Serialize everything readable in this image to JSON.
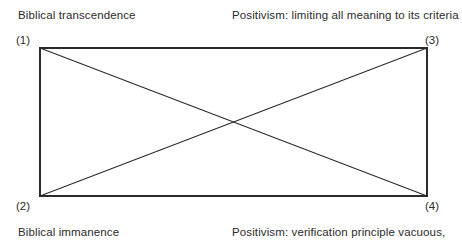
{
  "figure": {
    "type": "quadrant-cross-diagram",
    "background_color": "#ffffff",
    "line_color": "#2b2b2b",
    "text_color": "#2b2b2b",
    "rectangle": {
      "left": 40,
      "top": 48,
      "right": 427,
      "bottom": 196
    },
    "diagonals": [
      {
        "from": "top-left",
        "to": "bottom-right"
      },
      {
        "from": "bottom-left",
        "to": "top-right"
      }
    ],
    "corners": {
      "top_left": "(1)",
      "bottom_left": "(2)",
      "top_right": "(3)",
      "bottom_right": "(4)"
    },
    "captions": {
      "top_left": "Biblical transcendence",
      "top_right": "Positivism: limiting all meaning to its criteria",
      "bottom_left": "Biblical immanence",
      "bottom_right": "Positivism: verification principle vacuous,"
    }
  }
}
